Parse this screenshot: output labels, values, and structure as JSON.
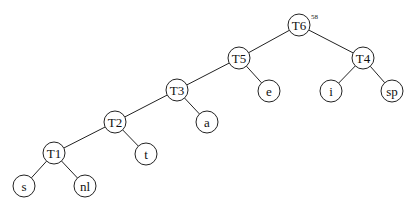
{
  "diagram": {
    "type": "huffman-tree",
    "root_weight": "58",
    "nodes": [
      {
        "id": "T6",
        "label": "T6",
        "x": 299,
        "y": 25
      },
      {
        "id": "T5",
        "label": "T5",
        "x": 239,
        "y": 58
      },
      {
        "id": "T4",
        "label": "T4",
        "x": 363,
        "y": 58
      },
      {
        "id": "T3",
        "label": "T3",
        "x": 177,
        "y": 90
      },
      {
        "id": "e",
        "label": "e",
        "x": 269,
        "y": 91
      },
      {
        "id": "i",
        "label": "i",
        "x": 331,
        "y": 91
      },
      {
        "id": "sp",
        "label": "sp",
        "x": 392,
        "y": 91
      },
      {
        "id": "T2",
        "label": "T2",
        "x": 115,
        "y": 122
      },
      {
        "id": "a",
        "label": "a",
        "x": 207,
        "y": 122
      },
      {
        "id": "T1",
        "label": "T1",
        "x": 54,
        "y": 153
      },
      {
        "id": "t",
        "label": "t",
        "x": 146,
        "y": 154
      },
      {
        "id": "s",
        "label": "s",
        "x": 24,
        "y": 186
      },
      {
        "id": "nl",
        "label": "nl",
        "x": 85,
        "y": 186
      }
    ],
    "edges": [
      [
        "T6",
        "T5"
      ],
      [
        "T6",
        "T4"
      ],
      [
        "T5",
        "T3"
      ],
      [
        "T5",
        "e"
      ],
      [
        "T4",
        "i"
      ],
      [
        "T4",
        "sp"
      ],
      [
        "T3",
        "T2"
      ],
      [
        "T3",
        "a"
      ],
      [
        "T2",
        "T1"
      ],
      [
        "T2",
        "t"
      ],
      [
        "T1",
        "s"
      ],
      [
        "T1",
        "nl"
      ]
    ]
  }
}
